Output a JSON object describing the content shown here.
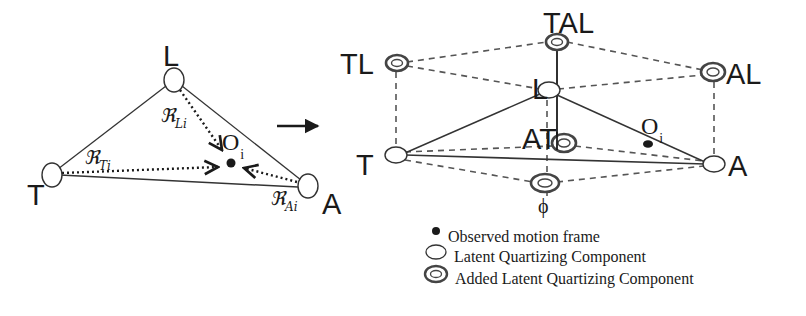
{
  "figure": {
    "transition_arrow": "right-arrow-icon",
    "left_diagram": {
      "nodes": [
        {
          "id": "L",
          "label": "L",
          "x": 174,
          "y": 80
        },
        {
          "id": "T",
          "label": "T",
          "x": 50,
          "y": 175
        },
        {
          "id": "A",
          "label": "A",
          "x": 308,
          "y": 187
        }
      ],
      "observation": {
        "label": "O",
        "subscript": "i",
        "x": 231,
        "y": 163
      },
      "relations": [
        {
          "from": "L",
          "symbol": "ℜ",
          "subscript": "Li"
        },
        {
          "from": "T",
          "symbol": "ℜ",
          "subscript": "Ti"
        },
        {
          "from": "A",
          "symbol": "ℜ",
          "subscript": "Ai"
        }
      ]
    },
    "right_diagram": {
      "latent_nodes": [
        {
          "id": "L",
          "label": "L"
        },
        {
          "id": "T",
          "label": "T"
        },
        {
          "id": "A",
          "label": "A"
        }
      ],
      "added_nodes": [
        {
          "id": "TL",
          "label": "TL"
        },
        {
          "id": "TAL",
          "label": "TAL"
        },
        {
          "id": "AL",
          "label": "AL"
        },
        {
          "id": "AT",
          "label": "AT"
        },
        {
          "id": "phi",
          "label": "ϕ"
        }
      ],
      "observation": {
        "label": "O",
        "subscript": "i"
      }
    },
    "legend": {
      "items": [
        {
          "icon": "filled-dot-icon",
          "label": "Observed motion frame"
        },
        {
          "icon": "open-ellipse-icon",
          "label": "Latent Quartizing Component"
        },
        {
          "icon": "double-ring-icon",
          "label": "Added Latent Quartizing Component"
        }
      ]
    },
    "colors": {
      "ink": "#1a1a1a",
      "dashed": "#555555",
      "ring": "#444444",
      "background": "#ffffff"
    }
  }
}
